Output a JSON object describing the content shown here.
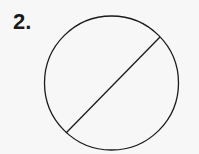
{
  "problem": {
    "number_label": "2."
  },
  "figure": {
    "type": "circle-with-chord",
    "circle": {
      "cx": 111.5,
      "cy": 83,
      "r": 67
    },
    "chord": {
      "x1": 160,
      "y1": 37,
      "x2": 66,
      "y2": 133
    },
    "stroke_color": "#1a1a1a",
    "background_color": "#f7f7f7"
  }
}
